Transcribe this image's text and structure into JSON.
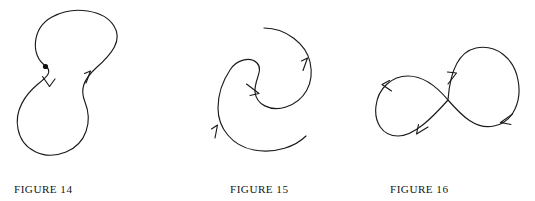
{
  "page": {
    "background_color": "#ffffff",
    "ink_color": "#1a1a1a",
    "width": 535,
    "height": 201
  },
  "figures": [
    {
      "id": "figure-14",
      "caption": "FIGURE 14",
      "shape_name": "closed-peanut-loop",
      "description": "Closed peanut / gourd shaped curve with a marked base point and two direction arrows",
      "markers": {
        "base_point": true,
        "arrow_count": 2,
        "arrow_directions": [
          "down",
          "up"
        ]
      }
    },
    {
      "id": "figure-15",
      "caption": "FIGURE 15",
      "shape_name": "open-s-spiral-arc",
      "description": "Open S-shaped spiral arc with three direction arrows and two free endpoints",
      "markers": {
        "base_point": false,
        "arrow_count": 3,
        "arrow_directions": [
          "up",
          "right-down",
          "up"
        ]
      }
    },
    {
      "id": "figure-16",
      "caption": "FIGURE 16",
      "shape_name": "figure-eight-lemniscate",
      "description": "Self-intersecting figure-eight loop with four direction arrows",
      "markers": {
        "base_point": false,
        "arrow_count": 4,
        "arrow_directions": [
          "up-left",
          "down-left",
          "up-right",
          "left"
        ]
      }
    }
  ]
}
